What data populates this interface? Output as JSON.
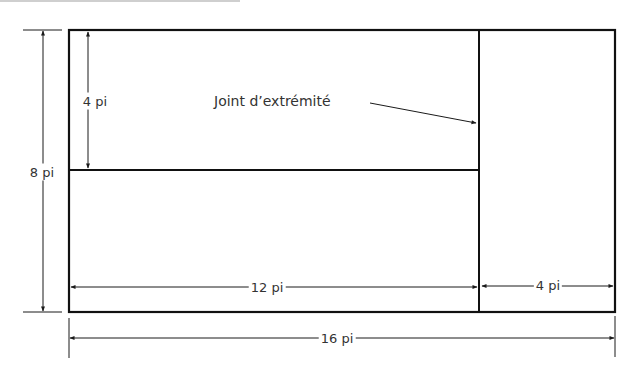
{
  "diagram": {
    "type": "floor-layout-dimensions",
    "unit": "pi",
    "line_color": "#1a1a1a",
    "text_color": "#333333",
    "regions": [
      {
        "name": "top-left-panel",
        "width": "12 pi",
        "height": "4 pi"
      },
      {
        "name": "bottom-left-panel",
        "width": "12 pi",
        "height": "4 pi"
      },
      {
        "name": "right-panel",
        "width": "4 pi",
        "height": "8 pi"
      }
    ],
    "overall": {
      "width": "16 pi",
      "height": "8 pi"
    }
  },
  "labels": {
    "height_total": "8 pi",
    "height_top_panel": "4 pi",
    "annotation": "Joint d’extrémité",
    "width_left": "12 pi",
    "width_right": "4 pi",
    "width_total": "16 pi"
  }
}
